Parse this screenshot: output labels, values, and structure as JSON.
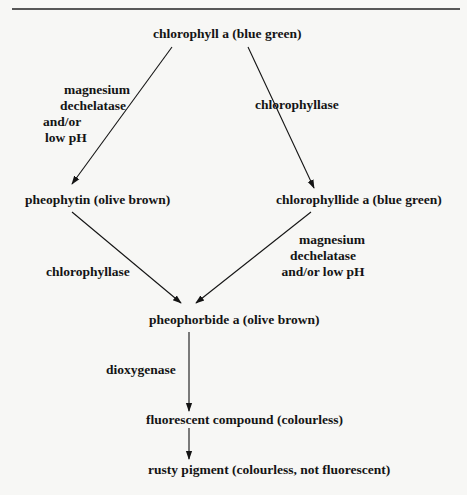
{
  "diagram": {
    "type": "pathway-flowchart",
    "nodes": {
      "chlorophyll_a": "chlorophyll a (blue green)",
      "pheophytin": "pheophytin (olive brown)",
      "chlorophyllide_a": "chlorophyllide a (blue green)",
      "pheophorbide_a": "pheophorbide a (olive brown)",
      "fluorescent_compound": "fluorescent compound (colourless)",
      "rusty_pigment": "rusty pigment (colourless, not fluorescent)"
    },
    "edges": [
      {
        "from": "chlorophyll_a",
        "to": "pheophytin",
        "label_lines": [
          "magnesium",
          "dechelatase",
          "and/or",
          "low pH"
        ]
      },
      {
        "from": "chlorophyll_a",
        "to": "chlorophyllide_a",
        "label_lines": [
          "chlorophyllase"
        ]
      },
      {
        "from": "pheophytin",
        "to": "pheophorbide_a",
        "label_lines": [
          "chlorophyllase"
        ]
      },
      {
        "from": "chlorophyllide_a",
        "to": "pheophorbide_a",
        "label_lines": [
          "magnesium",
          "dechelatase",
          "and/or low pH"
        ]
      },
      {
        "from": "pheophorbide_a",
        "to": "fluorescent_compound",
        "label_lines": [
          "dioxygenase"
        ]
      },
      {
        "from": "fluorescent_compound",
        "to": "rusty_pigment",
        "label_lines": []
      }
    ],
    "colors": {
      "ink": "#141414",
      "paper": "#f7f7f5"
    }
  }
}
